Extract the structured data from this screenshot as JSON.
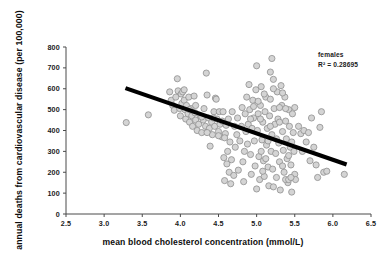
{
  "chart_data": {
    "type": "scatter",
    "title": "",
    "xlabel": "mean blood cholesterol concentration (mmol/L)",
    "ylabel": "annual deaths from cardiovascular disease (per 100,000)",
    "xlim": [
      2.5,
      6.5
    ],
    "ylim": [
      0,
      800
    ],
    "xticks": [
      "2.5",
      "3.0",
      "3.5",
      "4.0",
      "4.5",
      "5.0",
      "5.5",
      "6.0",
      "6.5"
    ],
    "xtick_values": [
      2.5,
      3.0,
      3.5,
      4.0,
      4.5,
      5.0,
      5.5,
      6.0,
      6.5
    ],
    "yticks": [
      "0",
      "100",
      "200",
      "300",
      "400",
      "500",
      "600",
      "700",
      "800"
    ],
    "ytick_values": [
      0,
      100,
      200,
      300,
      400,
      500,
      600,
      700,
      800
    ],
    "grid": false,
    "legend": "none",
    "marker_color": "#d4d4d4",
    "marker_edge_color": "#8f8f8f",
    "trendline_color": "#000000",
    "annotations": [
      {
        "name": "series-label",
        "text": "females"
      },
      {
        "name": "r-squared-label",
        "text": "R² = 0.28695"
      }
    ],
    "trendline": {
      "x": [
        3.28,
        6.18
      ],
      "y": [
        603,
        237
      ]
    },
    "series": [
      {
        "name": "females",
        "points": [
          [
            3.29,
            438
          ],
          [
            3.58,
            475
          ],
          [
            3.86,
            585
          ],
          [
            3.88,
            545
          ],
          [
            3.9,
            520
          ],
          [
            3.92,
            497
          ],
          [
            3.94,
            560
          ],
          [
            3.96,
            648
          ],
          [
            3.97,
            590
          ],
          [
            3.99,
            505
          ],
          [
            4.0,
            470
          ],
          [
            4.01,
            575
          ],
          [
            4.02,
            530
          ],
          [
            4.03,
            585
          ],
          [
            4.05,
            545
          ],
          [
            4.06,
            500
          ],
          [
            4.07,
            455
          ],
          [
            4.08,
            520
          ],
          [
            4.1,
            480
          ],
          [
            4.11,
            560
          ],
          [
            4.12,
            440
          ],
          [
            4.14,
            505
          ],
          [
            4.15,
            470
          ],
          [
            4.16,
            420
          ],
          [
            4.18,
            565
          ],
          [
            4.19,
            485
          ],
          [
            4.2,
            450
          ],
          [
            4.22,
            400
          ],
          [
            4.24,
            430
          ],
          [
            4.26,
            470
          ],
          [
            4.28,
            390
          ],
          [
            4.3,
            450
          ],
          [
            4.31,
            505
          ],
          [
            4.33,
            420
          ],
          [
            4.34,
            675
          ],
          [
            4.35,
            570
          ],
          [
            4.36,
            395
          ],
          [
            4.37,
            460
          ],
          [
            4.38,
            410
          ],
          [
            4.39,
            325
          ],
          [
            4.41,
            440
          ],
          [
            4.42,
            380
          ],
          [
            4.44,
            490
          ],
          [
            4.45,
            420
          ],
          [
            4.46,
            555
          ],
          [
            4.47,
            550
          ],
          [
            4.48,
            455
          ],
          [
            4.5,
            395
          ],
          [
            4.51,
            490
          ],
          [
            4.52,
            430
          ],
          [
            4.54,
            370
          ],
          [
            4.55,
            445
          ],
          [
            4.56,
            490
          ],
          [
            4.57,
            270
          ],
          [
            4.58,
            160
          ],
          [
            4.59,
            385
          ],
          [
            4.6,
            425
          ],
          [
            4.61,
            240
          ],
          [
            4.62,
            300
          ],
          [
            4.63,
            455
          ],
          [
            4.64,
            200
          ],
          [
            4.65,
            345
          ],
          [
            4.66,
            145
          ],
          [
            4.67,
            260
          ],
          [
            4.68,
            490
          ],
          [
            4.7,
            185
          ],
          [
            4.71,
            420
          ],
          [
            4.72,
            320
          ],
          [
            4.74,
            380
          ],
          [
            4.75,
            460
          ],
          [
            4.76,
            210
          ],
          [
            4.78,
            350
          ],
          [
            4.8,
            420
          ],
          [
            4.81,
            510
          ],
          [
            4.82,
            250
          ],
          [
            4.83,
            155
          ],
          [
            4.84,
            300
          ],
          [
            4.85,
            480
          ],
          [
            4.86,
            395
          ],
          [
            4.87,
            560
          ],
          [
            4.88,
            335
          ],
          [
            4.89,
            430
          ],
          [
            4.9,
            620
          ],
          [
            4.91,
            500
          ],
          [
            4.92,
            285
          ],
          [
            4.93,
            190
          ],
          [
            4.94,
            410
          ],
          [
            4.95,
            545
          ],
          [
            4.96,
            460
          ],
          [
            4.97,
            350
          ],
          [
            4.98,
            230
          ],
          [
            4.99,
            595
          ],
          [
            5.0,
            710
          ],
          [
            5.0,
            120
          ],
          [
            5.01,
            400
          ],
          [
            5.02,
            480
          ],
          [
            5.03,
            275
          ],
          [
            5.04,
            165
          ],
          [
            5.05,
            520
          ],
          [
            5.06,
            610
          ],
          [
            5.07,
            355
          ],
          [
            5.08,
            440
          ],
          [
            5.09,
            255
          ],
          [
            5.1,
            180
          ],
          [
            5.11,
            490
          ],
          [
            5.12,
            560
          ],
          [
            5.13,
            330
          ],
          [
            5.14,
            410
          ],
          [
            5.15,
            225
          ],
          [
            5.16,
            135
          ],
          [
            5.17,
            470
          ],
          [
            5.18,
            550
          ],
          [
            5.19,
            300
          ],
          [
            5.2,
            745
          ],
          [
            5.2,
            380
          ],
          [
            5.21,
            215
          ],
          [
            5.22,
            645
          ],
          [
            5.23,
            505
          ],
          [
            5.24,
            430
          ],
          [
            5.25,
            290
          ],
          [
            5.26,
            175
          ],
          [
            5.27,
            585
          ],
          [
            5.28,
            455
          ],
          [
            5.29,
            340
          ],
          [
            5.3,
            250
          ],
          [
            5.31,
            115
          ],
          [
            5.32,
            615
          ],
          [
            5.33,
            520
          ],
          [
            5.34,
            395
          ],
          [
            5.35,
            305
          ],
          [
            5.36,
            200
          ],
          [
            5.37,
            560
          ],
          [
            5.38,
            445
          ],
          [
            5.39,
            360
          ],
          [
            5.4,
            265
          ],
          [
            5.41,
            150
          ],
          [
            5.42,
            500
          ],
          [
            5.43,
            420
          ],
          [
            5.44,
            320
          ],
          [
            5.45,
            235
          ],
          [
            5.46,
            105
          ],
          [
            5.47,
            480
          ],
          [
            5.48,
            390
          ],
          [
            5.49,
            300
          ],
          [
            5.5,
            190
          ],
          [
            5.51,
            165
          ],
          [
            5.05,
            455
          ],
          [
            5.06,
            300
          ],
          [
            5.08,
            205
          ],
          [
            5.12,
            265
          ],
          [
            5.15,
            350
          ],
          [
            5.18,
            420
          ],
          [
            5.22,
            130
          ],
          [
            5.26,
            360
          ],
          [
            5.3,
            440
          ],
          [
            5.34,
            230
          ],
          [
            5.38,
            165
          ],
          [
            5.42,
            280
          ],
          [
            5.46,
            345
          ],
          [
            5.18,
            680
          ],
          [
            5.22,
            600
          ],
          [
            5.1,
            575
          ],
          [
            5.02,
            540
          ],
          [
            4.96,
            515
          ],
          [
            4.92,
            455
          ],
          [
            5.3,
            510
          ],
          [
            5.34,
            580
          ],
          [
            5.38,
            505
          ],
          [
            5.42,
            165
          ],
          [
            5.45,
            175
          ],
          [
            5.5,
            510
          ],
          [
            5.55,
            420
          ],
          [
            5.58,
            385
          ],
          [
            5.6,
            300
          ],
          [
            5.62,
            400
          ],
          [
            5.65,
            345
          ],
          [
            5.68,
            390
          ],
          [
            5.7,
            255
          ],
          [
            5.72,
            460
          ],
          [
            5.75,
            320
          ],
          [
            5.78,
            235
          ],
          [
            5.8,
            175
          ],
          [
            5.83,
            415
          ],
          [
            5.85,
            490
          ],
          [
            5.88,
            200
          ],
          [
            5.92,
            205
          ],
          [
            6.15,
            190
          ],
          [
            4.05,
            595
          ],
          [
            4.12,
            500
          ],
          [
            4.2,
            520
          ],
          [
            4.28,
            465
          ],
          [
            4.35,
            390
          ],
          [
            4.43,
            460
          ],
          [
            4.5,
            375
          ],
          [
            4.58,
            365
          ]
        ]
      }
    ]
  }
}
